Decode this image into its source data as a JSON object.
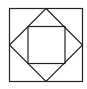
{
  "diagram": {
    "stroke_color": "#222222",
    "background": "#ffffff",
    "outer_square": {
      "x1": 9,
      "y1": 8,
      "x2": 83,
      "y2": 82
    },
    "diamond": {
      "top": [
        46,
        8
      ],
      "right": [
        83,
        45
      ],
      "bottom": [
        46,
        82
      ],
      "left": [
        9,
        45
      ]
    },
    "inner_square": {
      "x1": 28,
      "y1": 26,
      "x2": 65,
      "y2": 63
    }
  }
}
